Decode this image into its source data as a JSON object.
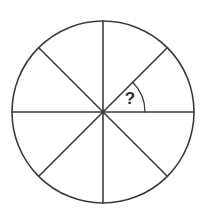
{
  "figure": {
    "title": "Circle divided into eight equal sectors with one unknown angle",
    "background_color": "#ffffff",
    "line_color": "#3a3a3a",
    "label_color": "#2e2e2e",
    "canvas": {
      "width": 205,
      "height": 221
    },
    "circle": {
      "center_x": 103,
      "center_y": 112,
      "radius": 91
    },
    "sector_count": 8,
    "sector_angle_degrees": 45,
    "spokes": [
      {
        "name": "spoke-right",
        "angle_degrees": 0,
        "end_x": 194,
        "end_y": 112
      },
      {
        "name": "spoke-upper-right",
        "angle_degrees": 45,
        "end_x": 167,
        "end_y": 48
      },
      {
        "name": "spoke-up",
        "angle_degrees": 90,
        "end_x": 103,
        "end_y": 21
      },
      {
        "name": "spoke-upper-left",
        "angle_degrees": 135,
        "end_x": 39,
        "end_y": 48
      },
      {
        "name": "spoke-left",
        "angle_degrees": 180,
        "end_x": 12,
        "end_y": 112
      },
      {
        "name": "spoke-lower-left",
        "angle_degrees": 225,
        "end_x": 39,
        "end_y": 176
      },
      {
        "name": "spoke-down",
        "angle_degrees": 270,
        "end_x": 103,
        "end_y": 203
      },
      {
        "name": "spoke-lower-right",
        "angle_degrees": 315,
        "end_x": 167,
        "end_y": 176
      }
    ],
    "angle_marker": {
      "label": "?",
      "arc_radius": 42,
      "start_angle_degrees": 0,
      "end_angle_degrees": 45,
      "label_x": 130,
      "label_y": 100
    }
  }
}
